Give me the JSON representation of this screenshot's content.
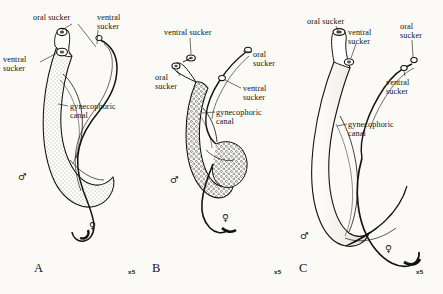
{
  "figure": {
    "scale_marker": "x5",
    "background_color": "#fbfaf6",
    "ink_color": "#15130f"
  },
  "symbols": {
    "male": "♂",
    "female": "♀"
  },
  "panels": [
    {
      "letter": "A",
      "scale": "x5",
      "male_texture": "stippled",
      "labels": [
        {
          "id": "a-oral-sucker",
          "text": "oral sucker",
          "x": 33,
          "y": 13,
          "align": "left"
        },
        {
          "id": "a-ventral-sucker-top",
          "text": "ventral\nsucker",
          "x": 97,
          "y": 13,
          "align": "left"
        },
        {
          "id": "a-ventral-sucker-left",
          "text": "ventral\nsucker",
          "x": 3,
          "y": 55,
          "align": "left"
        },
        {
          "id": "a-gynecophoric-canal",
          "text": "gynecophoric\ncanal",
          "x": 70,
          "y": 102,
          "align": "left"
        }
      ]
    },
    {
      "letter": "B",
      "scale": "x5",
      "male_texture": "tuberculate",
      "labels": [
        {
          "id": "b-ventral-sucker-top",
          "text": "ventral sucker",
          "x": 164,
          "y": 28,
          "align": "left"
        },
        {
          "id": "b-oral-sucker-right",
          "text": "oral\nsucker",
          "x": 253,
          "y": 50,
          "align": "left"
        },
        {
          "id": "b-oral-sucker-left",
          "text": "oral\nsucker",
          "x": 155,
          "y": 73,
          "align": "left"
        },
        {
          "id": "b-ventral-sucker-right",
          "text": "ventral\nsucker",
          "x": 243,
          "y": 84,
          "align": "left"
        },
        {
          "id": "b-gynecophoric-canal",
          "text": "gynecophoric\ncanal",
          "x": 216,
          "y": 108,
          "align": "left"
        }
      ]
    },
    {
      "letter": "C",
      "scale": "x5",
      "male_texture": "smooth",
      "labels": [
        {
          "id": "c-oral-sucker-left",
          "text": "oral sucker",
          "x": 307,
          "y": 17,
          "align": "left"
        },
        {
          "id": "c-ventral-sucker-mid",
          "text": "ventral\nsucker",
          "x": 348,
          "y": 28,
          "align": "left"
        },
        {
          "id": "c-oral-sucker-right",
          "text": "oral\nsucker",
          "x": 400,
          "y": 22,
          "align": "left"
        },
        {
          "id": "c-ventral-sucker-right",
          "text": "ventral\nsucker",
          "x": 386,
          "y": 78,
          "align": "left"
        },
        {
          "id": "c-gynecophoric-canal",
          "text": "gynecophoric\ncanal",
          "x": 348,
          "y": 120,
          "align": "left"
        }
      ]
    }
  ],
  "panel_letters": [
    {
      "text": "A",
      "x": 34,
      "y": 261
    },
    {
      "text": "B",
      "x": 152,
      "y": 261
    },
    {
      "text": "C",
      "x": 299,
      "y": 261
    }
  ],
  "scale_markers": [
    {
      "text": "x5",
      "x": 128,
      "y": 268
    },
    {
      "text": "x5",
      "x": 274,
      "y": 268
    },
    {
      "text": "x5",
      "x": 416,
      "y": 268
    }
  ],
  "sex_marks": [
    {
      "sex": "male",
      "symbol": "♂",
      "x": 18,
      "y": 171,
      "panel": "A"
    },
    {
      "sex": "female",
      "symbol": "♀",
      "x": 89,
      "y": 220,
      "panel": "A"
    },
    {
      "sex": "male",
      "symbol": "♂",
      "x": 170,
      "y": 174,
      "panel": "B"
    },
    {
      "sex": "female",
      "symbol": "♀",
      "x": 222,
      "y": 212,
      "panel": "B"
    },
    {
      "sex": "male",
      "symbol": "♂",
      "x": 300,
      "y": 230,
      "panel": "C"
    },
    {
      "sex": "female",
      "symbol": "♀",
      "x": 385,
      "y": 243,
      "panel": "C"
    }
  ]
}
